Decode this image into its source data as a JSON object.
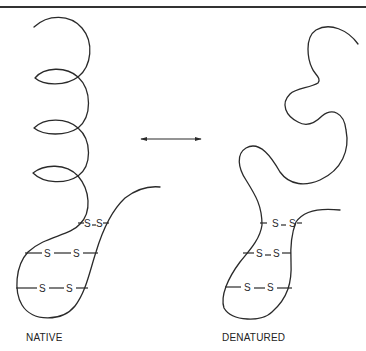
{
  "figure": {
    "type": "protein folding diagram",
    "panels": [
      {
        "id": "native",
        "label": "NATIVE",
        "structure": "alpha-helix coils (4 turns) with polypeptide loop",
        "disulfide_bonds": [
          {
            "atoms": [
              "S",
              "S"
            ],
            "position": "top"
          },
          {
            "atoms": [
              "S",
              "S"
            ],
            "position": "middle"
          },
          {
            "atoms": [
              "S",
              "S"
            ],
            "position": "bottom"
          }
        ]
      },
      {
        "id": "denatured",
        "label": "DENATURED",
        "structure": "random coil, unfolded chain",
        "disulfide_bonds": [
          {
            "atoms": [
              "S",
              "S"
            ],
            "position": "top"
          },
          {
            "atoms": [
              "S",
              "S"
            ],
            "position": "middle"
          },
          {
            "atoms": [
              "S",
              "S"
            ],
            "position": "bottom"
          }
        ]
      }
    ],
    "arrow": {
      "type": "double-headed",
      "meaning": "reversible equilibrium"
    },
    "colors": {
      "line": "#2a2a2a",
      "background": "#ffffff",
      "rule": "#333333"
    },
    "s_atom": "S"
  }
}
